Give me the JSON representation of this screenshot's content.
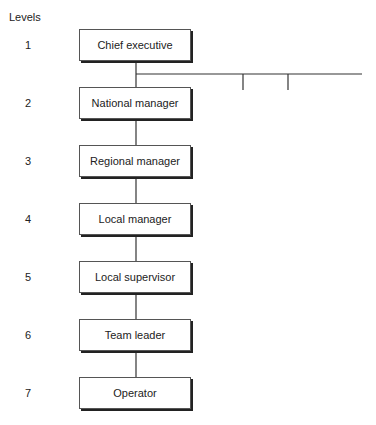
{
  "title": "Levels",
  "levels": [
    {
      "number": "1",
      "label": "Chief executive"
    },
    {
      "number": "2",
      "label": "National manager"
    },
    {
      "number": "3",
      "label": "Regional manager"
    },
    {
      "number": "4",
      "label": "Local manager"
    },
    {
      "number": "5",
      "label": "Local supervisor"
    },
    {
      "number": "6",
      "label": "Team leader"
    },
    {
      "number": "7",
      "label": "Operator"
    }
  ]
}
